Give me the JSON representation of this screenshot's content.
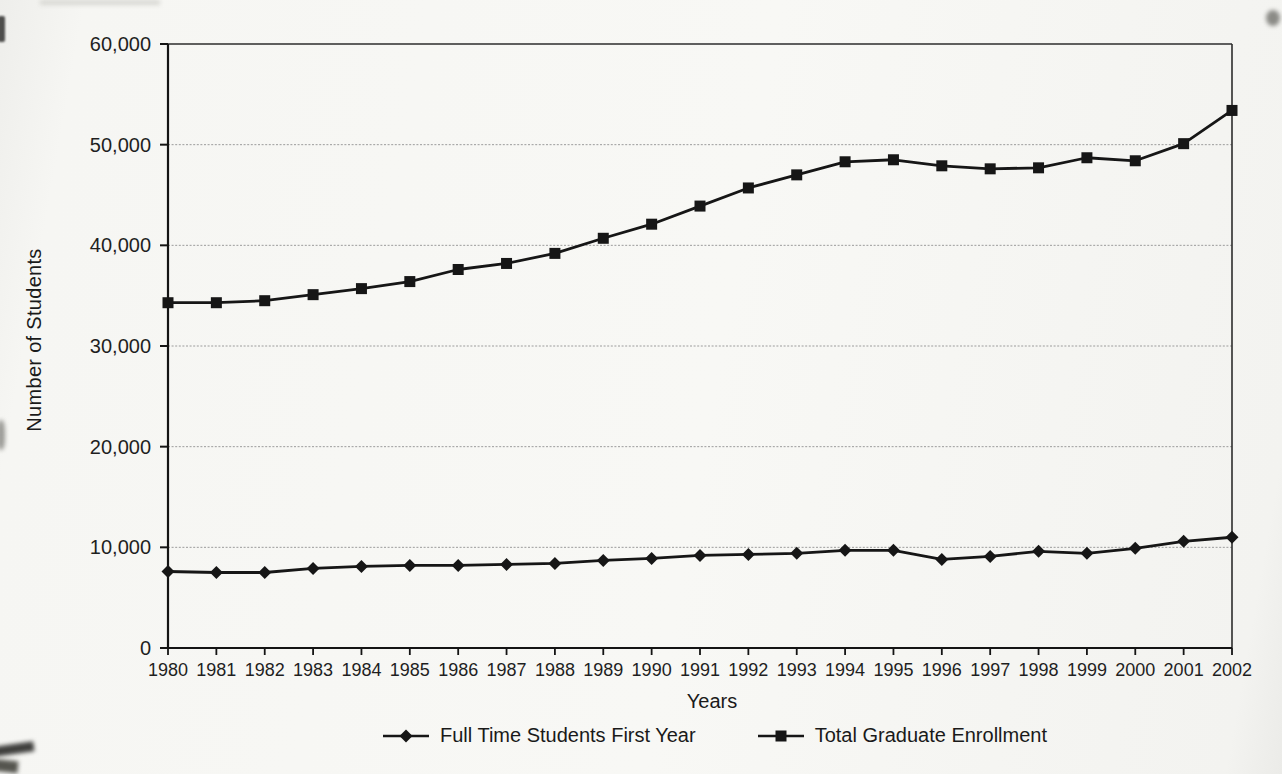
{
  "page": {
    "background_color": "#f6f6f3",
    "title": ""
  },
  "chart_data": {
    "type": "line",
    "title": "",
    "xlabel": "Years",
    "ylabel": "Number of Students",
    "ylim": [
      0,
      60000
    ],
    "y_tick_step": 10000,
    "y_tick_labels": [
      "0",
      "10,000",
      "20,000",
      "30,000",
      "40,000",
      "50,000",
      "60,000"
    ],
    "grid": "horizontal-only",
    "legend_position": "bottom-center",
    "line_color": "#161616",
    "gridline_color": "#9c9c9c",
    "text_color": "#1f1f1f",
    "categories": [
      1980,
      1981,
      1982,
      1983,
      1984,
      1985,
      1986,
      1987,
      1988,
      1989,
      1990,
      1991,
      1992,
      1993,
      1994,
      1995,
      1996,
      1997,
      1998,
      1999,
      2000,
      2001,
      2002
    ],
    "series": [
      {
        "name": "Full Time Students First Year",
        "marker": "diamond",
        "values": [
          7600,
          7500,
          7500,
          7900,
          8100,
          8200,
          8200,
          8300,
          8400,
          8700,
          8900,
          9200,
          9300,
          9400,
          9700,
          9700,
          8800,
          9100,
          9600,
          9400,
          9900,
          10600,
          11000
        ]
      },
      {
        "name": "Total Graduate Enrollment",
        "marker": "square",
        "values": [
          34300,
          34300,
          34500,
          35100,
          35700,
          36400,
          37600,
          38200,
          39200,
          40700,
          42100,
          43900,
          45700,
          47000,
          48300,
          48500,
          47900,
          47600,
          47700,
          48700,
          48400,
          50100,
          53400
        ]
      }
    ]
  }
}
